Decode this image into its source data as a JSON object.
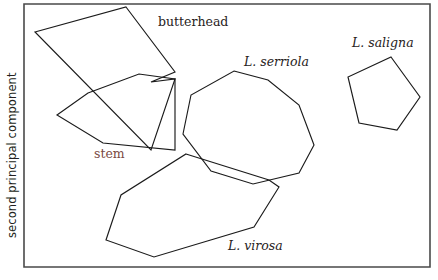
{
  "figure": {
    "background_color": "#ffffff",
    "frame": {
      "stroke_color": "#4a4a4a",
      "left": 24,
      "top": 4,
      "right": 430,
      "bottom": 267
    },
    "axes": {
      "y_label": "second principal component",
      "y_label_color": "#231f20"
    }
  },
  "chart_data": {
    "type": "scatter",
    "title": "",
    "xlabel": "",
    "ylabel": "second principal component",
    "grid": false,
    "legend_position": "inline-annotations",
    "xlim": [
      24,
      430
    ],
    "ylim": [
      4,
      267
    ],
    "groups": [
      {
        "name": "butterhead",
        "style": "regular",
        "label_color": "#272222",
        "label_x": 158,
        "label_y": 26,
        "hull": [
          [
            126,
            7
          ],
          [
            175,
            72
          ],
          [
            151,
            82
          ],
          [
            175,
            79
          ],
          [
            151,
            150
          ],
          [
            35,
            32
          ]
        ]
      },
      {
        "name": "stem",
        "style": "regular",
        "label_color": "#7a4a43",
        "label_x": 94,
        "label_y": 158,
        "hull": [
          [
            88,
            93
          ],
          [
            139,
            74
          ],
          [
            175,
            79
          ],
          [
            175,
            150
          ],
          [
            103,
            143
          ],
          [
            57,
            115
          ]
        ]
      },
      {
        "name": "L. serriola",
        "style": "italic",
        "label_color": "#272222",
        "label_x": 244,
        "label_y": 66,
        "hull": [
          [
            234,
            71
          ],
          [
            268,
            80
          ],
          [
            299,
            105
          ],
          [
            314,
            145
          ],
          [
            299,
            173
          ],
          [
            253,
            184
          ],
          [
            211,
            171
          ],
          [
            183,
            134
          ],
          [
            191,
            95
          ]
        ]
      },
      {
        "name": "L. saligna",
        "style": "italic",
        "label_color": "#272222",
        "label_x": 352,
        "label_y": 47,
        "hull": [
          [
            391,
            57
          ],
          [
            420,
            97
          ],
          [
            397,
            130
          ],
          [
            359,
            123
          ],
          [
            348,
            77
          ]
        ]
      },
      {
        "name": "L. virosa",
        "style": "italic",
        "label_color": "#272222",
        "label_x": 228,
        "label_y": 250,
        "hull": [
          [
            186,
            154
          ],
          [
            269,
            180
          ],
          [
            279,
            187
          ],
          [
            254,
            227
          ],
          [
            154,
            257
          ],
          [
            106,
            240
          ],
          [
            121,
            195
          ]
        ]
      }
    ]
  }
}
